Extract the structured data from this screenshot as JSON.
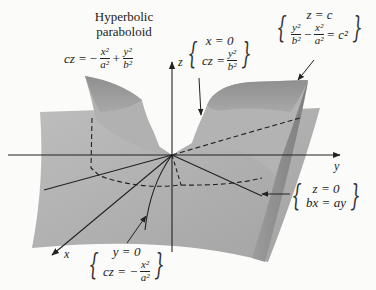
{
  "title": {
    "line1": "Hyperbolic",
    "line2": "paraboloid"
  },
  "surface_equation": {
    "lhs": "cz =",
    "sign1": "−",
    "term1_num": "x²",
    "term1_den": "a²",
    "op": "+",
    "term2_num": "y²",
    "term2_den": "b²"
  },
  "axes": {
    "x": "x",
    "y": "y",
    "z": "z"
  },
  "trace_x0": {
    "line1": "x = 0",
    "lhs": "cz =",
    "num": "y²",
    "den": "b²"
  },
  "trace_zc": {
    "line1": "z = c",
    "num1": "y²",
    "den1": "b²",
    "op": "−",
    "num2": "x²",
    "den2": "a²",
    "rhs": "= c²"
  },
  "trace_z0": {
    "line1": "z = 0",
    "line2": "bx = ay"
  },
  "trace_y0": {
    "line1": "y = 0",
    "lhs": "cz = −",
    "num": "x²",
    "den": "a²"
  },
  "colors": {
    "background": "#fbfbf9",
    "surface_light": "#b8b8b8",
    "surface_mid": "#a6a6a6",
    "surface_dark": "#8a8a8a",
    "ink": "#222222"
  }
}
